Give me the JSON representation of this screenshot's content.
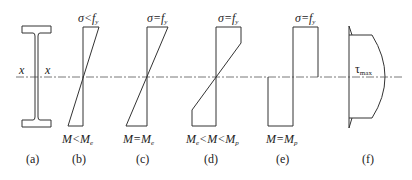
{
  "figure": {
    "axis_label": "x",
    "panels": [
      {
        "id": "a",
        "caption": "(a)",
        "content": "I-section with neutral axis x–x"
      },
      {
        "id": "b",
        "caption": "(b)",
        "stress_label": "σ<f",
        "stress_sub": "y",
        "moment_left": "M<M",
        "moment_sub": "e"
      },
      {
        "id": "c",
        "caption": "(c)",
        "stress_label": "σ=f",
        "stress_sub": "y",
        "moment_left": "M=M",
        "moment_sub": "e"
      },
      {
        "id": "d",
        "caption": "(d)",
        "stress_label": "σ=f",
        "stress_sub": "y",
        "moment_pre": "M",
        "moment_pre_sub": "e",
        "moment_mid": "<M<M",
        "moment_sub": "p"
      },
      {
        "id": "e",
        "caption": "(e)",
        "stress_label": "σ=f",
        "stress_sub": "y",
        "moment_left": "M=M",
        "moment_sub": "p"
      },
      {
        "id": "f",
        "caption": "(f)",
        "shear_label": "τ",
        "shear_sub": "max"
      }
    ]
  }
}
